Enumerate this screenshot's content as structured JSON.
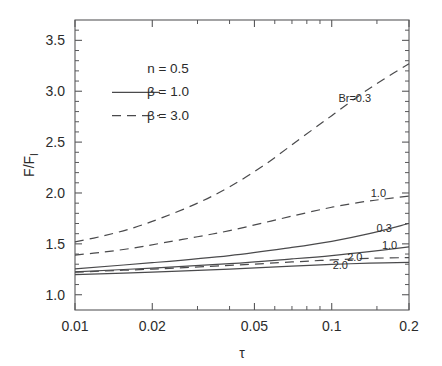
{
  "chart_data": {
    "type": "line",
    "title": "",
    "xlabel": "τ",
    "ylabel": "F/F_I",
    "ylabel_main": "F/F",
    "ylabel_sub": "I",
    "xscale": "log",
    "yscale": "linear",
    "xlim": [
      0.01,
      0.2
    ],
    "ylim": [
      0.85,
      3.7
    ],
    "grid": false,
    "legend_position": "upper-left-inside",
    "x_tick_labels": [
      "0.01",
      "0.02",
      "0.05",
      "0.1",
      "0.2"
    ],
    "x_tick_values": [
      0.01,
      0.02,
      0.05,
      0.1,
      0.2
    ],
    "x_minor_ticks": [
      0.03,
      0.04,
      0.06,
      0.07,
      0.08,
      0.09,
      0.15
    ],
    "y_tick_labels": [
      "1.0",
      "1.5",
      "2.0",
      "2.5",
      "3.0",
      "3.5"
    ],
    "y_tick_values": [
      1.0,
      1.5,
      2.0,
      2.5,
      3.0,
      3.5
    ],
    "y_minor_ticks": [
      1.1,
      1.2,
      1.3,
      1.4,
      1.6,
      1.7,
      1.8,
      1.9,
      2.1,
      2.2,
      2.3,
      2.4,
      2.6,
      2.7,
      2.8,
      2.9,
      3.1,
      3.2,
      3.3,
      3.4,
      3.6
    ],
    "annotations": [
      {
        "text": "n = 0.5",
        "x": 0.0195,
        "y": 3.18
      },
      {
        "text": "β = 1.0",
        "x": 0.0195,
        "y": 2.95
      },
      {
        "text": "β = 3.0",
        "x": 0.0195,
        "y": 2.72
      }
    ],
    "legend_entries": [
      {
        "label": "n = 0.5",
        "style": "none"
      },
      {
        "label": "β = 1.0",
        "style": "solid"
      },
      {
        "label": "β = 3.0",
        "style": "dashed"
      }
    ],
    "series": [
      {
        "name": "Br=0.3, beta=3.0",
        "label": "Br=0.3",
        "style": "dashed",
        "x": [
          0.01,
          0.013,
          0.017,
          0.022,
          0.03,
          0.04,
          0.055,
          0.075,
          0.1,
          0.13,
          0.16,
          0.2
        ],
        "values": [
          1.52,
          1.58,
          1.66,
          1.76,
          1.9,
          2.06,
          2.28,
          2.53,
          2.76,
          2.97,
          3.12,
          3.27
        ]
      },
      {
        "name": "Br=1.0, beta=3.0",
        "label": "1.0",
        "style": "dashed",
        "x": [
          0.01,
          0.013,
          0.017,
          0.022,
          0.03,
          0.04,
          0.055,
          0.075,
          0.1,
          0.13,
          0.16,
          0.2
        ],
        "values": [
          1.39,
          1.42,
          1.46,
          1.51,
          1.57,
          1.63,
          1.71,
          1.79,
          1.86,
          1.91,
          1.94,
          1.97
        ]
      },
      {
        "name": "Br=0.3, beta=1.0",
        "label": "0.3",
        "style": "solid",
        "x": [
          0.01,
          0.02,
          0.04,
          0.07,
          0.1,
          0.14,
          0.2
        ],
        "values": [
          1.255,
          1.315,
          1.385,
          1.465,
          1.525,
          1.6,
          1.7
        ]
      },
      {
        "name": "Br=1.0, beta=1.0",
        "label": "1.0",
        "style": "solid",
        "x": [
          0.01,
          0.02,
          0.04,
          0.07,
          0.1,
          0.14,
          0.2
        ],
        "values": [
          1.225,
          1.262,
          1.305,
          1.352,
          1.385,
          1.424,
          1.47
        ]
      },
      {
        "name": "Br=2.0, beta=3.0",
        "label": "2.0",
        "style": "dashed",
        "x": [
          0.01,
          0.02,
          0.04,
          0.07,
          0.1,
          0.14,
          0.2
        ],
        "values": [
          1.222,
          1.252,
          1.288,
          1.322,
          1.342,
          1.358,
          1.365
        ]
      },
      {
        "name": "Br=2.0, beta=1.0",
        "label": "2.0",
        "style": "solid",
        "x": [
          0.01,
          0.02,
          0.04,
          0.07,
          0.1,
          0.14,
          0.2
        ],
        "values": [
          1.197,
          1.222,
          1.252,
          1.282,
          1.298,
          1.31,
          1.318
        ]
      }
    ],
    "curve_labels": [
      {
        "text": "Br=0.3",
        "x": 0.123,
        "y": 2.93,
        "anchor": "middle"
      },
      {
        "text": "1.0",
        "x": 0.152,
        "y": 2.0,
        "anchor": "middle"
      },
      {
        "text": "0.3",
        "x": 0.16,
        "y": 1.655,
        "anchor": "middle"
      },
      {
        "text": "1.0",
        "x": 0.168,
        "y": 1.485,
        "anchor": "middle"
      },
      {
        "text": "2.0",
        "x": 0.123,
        "y": 1.373,
        "anchor": "middle"
      },
      {
        "text": "2.0",
        "x": 0.108,
        "y": 1.288,
        "anchor": "middle"
      }
    ],
    "colors": {
      "line": "#4a4a4c",
      "axis": "#58585a",
      "text": "#2b2b2b",
      "background": "#ffffff"
    }
  }
}
